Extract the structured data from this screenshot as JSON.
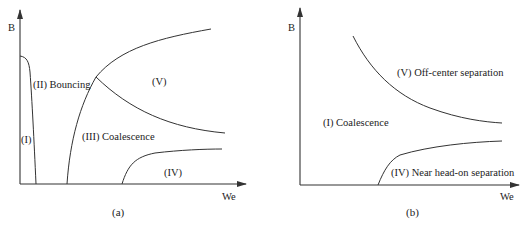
{
  "panels": [
    {
      "id": "a",
      "caption": "(a)",
      "y_axis_label": "B",
      "x_axis_label": "We",
      "regions": [
        {
          "label": "(I)"
        },
        {
          "label": "(II) Bouncing"
        },
        {
          "label": "(III) Coalescence"
        },
        {
          "label": "(IV)"
        },
        {
          "label": "(V)"
        }
      ]
    },
    {
      "id": "b",
      "caption": "(b)",
      "y_axis_label": "B",
      "x_axis_label": "We",
      "regions": [
        {
          "label": "(I) Coalescence"
        },
        {
          "label": "(V) Off-center separation"
        },
        {
          "label": "(IV) Near head-on separation"
        }
      ]
    }
  ],
  "colors": {
    "line": "#333333",
    "text": "#222222",
    "background": "#ffffff"
  }
}
